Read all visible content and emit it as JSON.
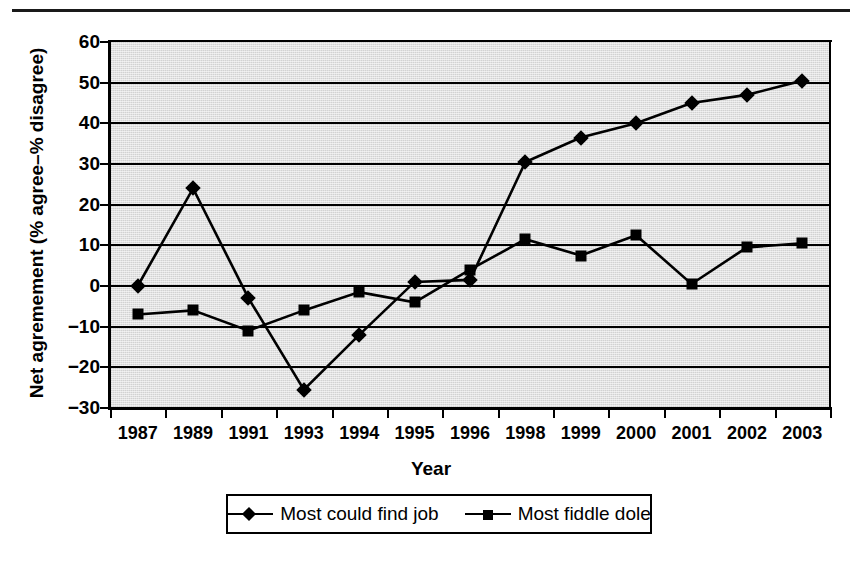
{
  "figure": {
    "has_top_rule": true,
    "background_color": "#ffffff",
    "plot_fill_color": "#d2d2d2",
    "ink_color": "#000000"
  },
  "chart_data": {
    "type": "line",
    "title": "",
    "xlabel": "Year",
    "ylabel": "Net agremement (% agree–% disagree)",
    "categories": [
      "1987",
      "1989",
      "1991",
      "1993",
      "1994",
      "1995",
      "1996",
      "1998",
      "1999",
      "2000",
      "2001",
      "2002",
      "2003"
    ],
    "ylim": [
      -30,
      60
    ],
    "yticks": [
      60,
      50,
      40,
      30,
      20,
      10,
      0,
      -10,
      -20,
      -30
    ],
    "ytick_labels": [
      "60",
      "50",
      "40",
      "30",
      "20",
      "10",
      "0",
      "−10",
      "−20",
      "−30"
    ],
    "grid": true,
    "grid_axis": "y",
    "legend_position": "below-center",
    "series": [
      {
        "name": "Most could find job",
        "marker": "diamond",
        "values": [
          0,
          24,
          -3,
          -25.5,
          -12,
          1,
          1.5,
          30.5,
          36.5,
          40,
          45,
          47,
          50.5
        ]
      },
      {
        "name": "Most fiddle dole",
        "marker": "square",
        "values": [
          -7,
          -6,
          -11,
          -6,
          -1.5,
          -4,
          4,
          11.5,
          7.5,
          12.5,
          0.5,
          9.5,
          10.5
        ]
      }
    ]
  },
  "legend": {
    "entries": [
      {
        "label": "Most could find job",
        "marker": "diamond"
      },
      {
        "label": "Most fiddle dole",
        "marker": "square"
      }
    ]
  }
}
